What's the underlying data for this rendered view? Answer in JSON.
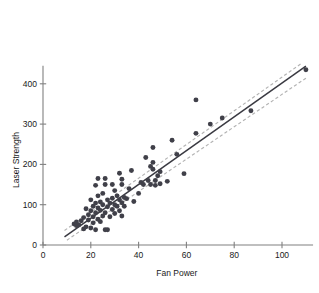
{
  "chart_data": {
    "type": "scatter",
    "title": "",
    "xlabel": "Fan Power",
    "ylabel": "Laser Strength",
    "xlim": [
      0,
      113
    ],
    "ylim": [
      0,
      445
    ],
    "xticks": [
      0,
      20,
      40,
      60,
      80,
      100
    ],
    "yticks": [
      0,
      100,
      200,
      300,
      400
    ],
    "xtick_labels": [
      "0",
      "20",
      "40",
      "60",
      "80",
      "100"
    ],
    "ytick_labels": [
      "0",
      "100",
      "200",
      "300",
      "400"
    ],
    "grid": false,
    "legend": null,
    "colors": {
      "point": "#404049",
      "regression_line": "#3a3a42",
      "confidence_band": "#b3b3b3",
      "axis": "#808080",
      "text": "#1a1a1a",
      "background": "#ffffff"
    },
    "series": [
      {
        "name": "observations",
        "marker": "filled-circle",
        "points": [
          [
            13,
            52
          ],
          [
            14,
            48
          ],
          [
            14,
            57
          ],
          [
            15,
            50
          ],
          [
            16,
            60
          ],
          [
            17,
            40
          ],
          [
            17,
            68
          ],
          [
            18,
            45
          ],
          [
            18,
            90
          ],
          [
            19,
            62
          ],
          [
            19,
            75
          ],
          [
            20,
            42
          ],
          [
            20,
            85
          ],
          [
            20,
            112
          ],
          [
            21,
            55
          ],
          [
            21,
            70
          ],
          [
            21,
            96
          ],
          [
            22,
            38
          ],
          [
            22,
            80
          ],
          [
            22,
            104
          ],
          [
            22,
            148
          ],
          [
            23,
            64
          ],
          [
            23,
            92
          ],
          [
            23,
            122
          ],
          [
            23,
            165
          ],
          [
            24,
            58
          ],
          [
            24,
            86
          ],
          [
            24,
            107
          ],
          [
            25,
            72
          ],
          [
            25,
            100
          ],
          [
            25,
            128
          ],
          [
            26,
            38
          ],
          [
            26,
            80
          ],
          [
            26,
            150
          ],
          [
            26,
            165
          ],
          [
            27,
            95
          ],
          [
            27,
            112
          ],
          [
            27,
            38
          ],
          [
            28,
            70
          ],
          [
            28,
            104
          ],
          [
            29,
            88
          ],
          [
            29,
            116
          ],
          [
            29,
            150
          ],
          [
            30,
            78
          ],
          [
            30,
            100
          ],
          [
            30,
            135
          ],
          [
            31,
            96
          ],
          [
            31,
            122
          ],
          [
            32,
            85
          ],
          [
            32,
            112
          ],
          [
            32,
            178
          ],
          [
            33,
            72
          ],
          [
            33,
            105
          ],
          [
            33,
            150
          ],
          [
            33,
            163
          ],
          [
            34,
            118
          ],
          [
            34,
            96
          ],
          [
            35,
            115
          ],
          [
            36,
            140
          ],
          [
            37,
            185
          ],
          [
            38,
            108
          ],
          [
            40,
            128
          ],
          [
            41,
            155
          ],
          [
            42,
            150
          ],
          [
            43,
            217
          ],
          [
            44,
            160
          ],
          [
            45,
            195
          ],
          [
            45,
            150
          ],
          [
            46,
            205
          ],
          [
            46,
            188
          ],
          [
            46,
            242
          ],
          [
            47,
            160
          ],
          [
            47,
            148
          ],
          [
            48,
            172
          ],
          [
            49,
            152
          ],
          [
            49,
            182
          ],
          [
            52,
            158
          ],
          [
            54,
            260
          ],
          [
            56,
            225
          ],
          [
            59,
            177
          ],
          [
            64,
            277
          ],
          [
            64,
            360
          ],
          [
            70,
            300
          ],
          [
            75,
            315
          ],
          [
            87,
            333
          ],
          [
            110,
            435
          ]
        ]
      }
    ],
    "fit": {
      "name": "least-squares-regression",
      "style": "solid",
      "x_start": 9,
      "y_start": 20,
      "x_end": 110,
      "y_end": 444
    },
    "bands": [
      {
        "name": "upper-confidence-band",
        "style": "dashed",
        "x_start": 9,
        "y_start": 36,
        "x_end": 108,
        "y_end": 450
      },
      {
        "name": "lower-confidence-band",
        "style": "dashed",
        "x_start": 10,
        "y_start": 12,
        "x_end": 110,
        "y_end": 414
      }
    ]
  }
}
